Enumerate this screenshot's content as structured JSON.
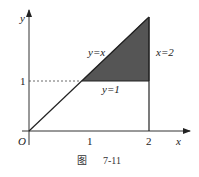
{
  "figure": {
    "caption_prefix": "图",
    "caption_number": "7-11"
  },
  "axes": {
    "x_label": "x",
    "y_label": "y",
    "origin_label": "O",
    "x_ticks": [
      "1",
      "2"
    ],
    "y_ticks": [
      "1"
    ]
  },
  "curves": {
    "line_diag": "y=x",
    "line_horizontal": "y=1",
    "line_vertical": "x=2"
  },
  "region": {
    "description": "shaded triangle bounded by y=x, y=1, x=2",
    "vertices": [
      [
        1,
        1
      ],
      [
        2,
        1
      ],
      [
        2,
        2
      ]
    ],
    "fill_color": "#555555"
  },
  "colors": {
    "axis": "#333333",
    "line": "#222222",
    "shade": "#555555"
  }
}
